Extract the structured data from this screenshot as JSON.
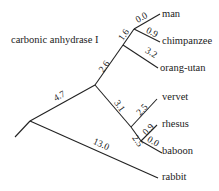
{
  "title": "carbonic anhydrase I",
  "leaves": [
    {
      "name": "man",
      "x": 162,
      "y": 8
    },
    {
      "name": "chimpanzee",
      "x": 162,
      "y": 36
    },
    {
      "name": "orang-utan",
      "x": 160,
      "y": 62
    },
    {
      "name": "vervet",
      "x": 162,
      "y": 92
    },
    {
      "name": "rhesus",
      "x": 162,
      "y": 119
    },
    {
      "name": "baboon",
      "x": 162,
      "y": 146
    },
    {
      "name": "rabbit",
      "x": 162,
      "y": 172
    }
  ],
  "branch_lengths": {
    "man": "0.0",
    "chimpanzee": "0.9",
    "great_ape_ancestor": "1.6",
    "orang_utan": "3.2",
    "hominoid_stem": "2.6",
    "primate_stem": "4.7",
    "old_world_monkey_stem": "3.1",
    "vervet": "2.5",
    "rhesus_baboon_stem": "2.5",
    "rhesus": "0.9",
    "baboon": "0.0",
    "rabbit": "13.0"
  }
}
